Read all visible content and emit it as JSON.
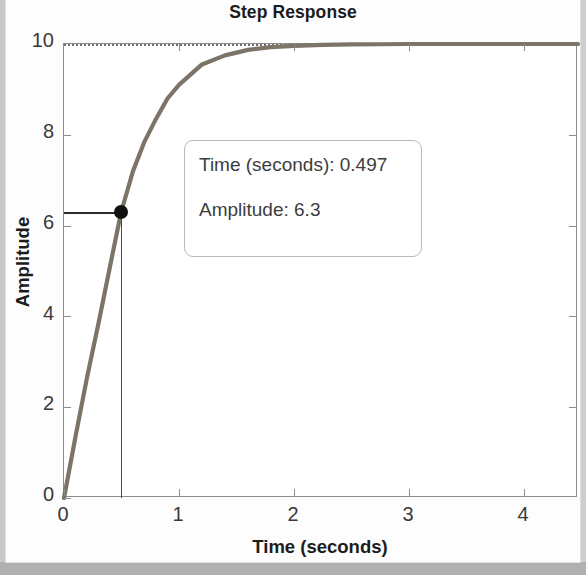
{
  "figure": {
    "title": "Step Response",
    "xlabel": "Time (seconds)",
    "ylabel": "Amplitude"
  },
  "datatip": {
    "time_label": "Time (seconds): 0.497",
    "amplitude_label": "Amplitude: 6.3"
  },
  "chart_data": {
    "type": "line",
    "title": "Step Response",
    "xlabel": "Time (seconds)",
    "ylabel": "Amplitude",
    "xlim": [
      0,
      4.47
    ],
    "ylim": [
      0,
      10
    ],
    "xticks": [
      0,
      1,
      2,
      3,
      4
    ],
    "yticks": [
      0,
      2,
      4,
      6,
      8,
      10
    ],
    "xticklabels": [
      "0",
      "1",
      "2",
      "3",
      "4"
    ],
    "yticklabels": [
      "0",
      "2",
      "4",
      "6",
      "8",
      "10"
    ],
    "grid": false,
    "legend": null,
    "series": [
      {
        "name": "step response",
        "color": "#7d7468",
        "x": [
          0,
          0.1,
          0.2,
          0.3,
          0.4,
          0.497,
          0.6,
          0.7,
          0.8,
          0.9,
          1.0,
          1.2,
          1.4,
          1.6,
          1.8,
          2.0,
          2.25,
          2.5,
          2.75,
          3.0,
          3.5,
          4.0,
          4.47
        ],
        "y": [
          0,
          1.35,
          2.65,
          3.85,
          5.1,
          6.3,
          7.2,
          7.85,
          8.35,
          8.8,
          9.1,
          9.55,
          9.75,
          9.87,
          9.93,
          9.96,
          9.98,
          9.99,
          9.995,
          10.0,
          10.0,
          10.0,
          10.0
        ]
      },
      {
        "name": "steady-state reference",
        "style": "dotted",
        "color": "#6e6e6e",
        "y_constant": 10
      }
    ],
    "annotations": [
      {
        "type": "datatip",
        "x": 0.497,
        "y": 6.3,
        "text": [
          "Time (seconds): 0.497",
          "Amplitude: 6.3"
        ]
      }
    ]
  }
}
